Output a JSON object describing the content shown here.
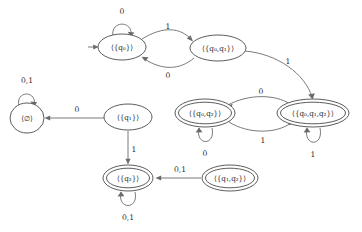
{
  "diagram": {
    "type": "finite-state-machine",
    "alphabet": [
      "0",
      "1"
    ],
    "stroke_color": "#6b6b6b",
    "node_color": "#4a4a4a",
    "text_color": "#2b2b2b",
    "background": "#ffffff",
    "start_state": "q0_set",
    "states": [
      {
        "id": "q0_set",
        "label": "⟨{q₀}⟩",
        "accepting": false,
        "x": 122,
        "y": 47,
        "rx": 24,
        "ry": 13
      },
      {
        "id": "q0q1_set",
        "label": "⟨{q₀,q₁}⟩",
        "accepting": false,
        "x": 218,
        "y": 48,
        "rx": 28,
        "ry": 13
      },
      {
        "id": "empty_set",
        "label": "⟨∅⟩",
        "accepting": false,
        "x": 27,
        "y": 118,
        "rx": 17,
        "ry": 15
      },
      {
        "id": "q1_set",
        "label": "⟨{q₁}⟩",
        "accepting": false,
        "x": 128,
        "y": 117,
        "rx": 24,
        "ry": 13
      },
      {
        "id": "q0q2_set",
        "label": "⟨{q₀,q₂}⟩",
        "accepting": true,
        "x": 205,
        "y": 113,
        "rx": 30,
        "ry": 14
      },
      {
        "id": "q0q1q2_set",
        "label": "⟨{q₀,q₁,q₂}⟩",
        "accepting": true,
        "x": 313,
        "y": 113,
        "rx": 36,
        "ry": 14
      },
      {
        "id": "q2_set",
        "label": "⟨{q₂}⟩",
        "accepting": true,
        "x": 128,
        "y": 178,
        "rx": 25,
        "ry": 13
      },
      {
        "id": "q1q2_set",
        "label": "⟨{q₁,q₂}⟩",
        "accepting": true,
        "x": 230,
        "y": 178,
        "rx": 28,
        "ry": 13
      }
    ],
    "transitions": [
      {
        "id": "t1",
        "from": "q0_set",
        "to": "q0_set",
        "symbol": "0",
        "label_x": 122,
        "label_y": 12,
        "kind": "self-loop-top"
      },
      {
        "id": "t2",
        "from": "q0_set",
        "to": "q0q1_set",
        "symbol": "1",
        "label_x": 168,
        "label_y": 27,
        "kind": "arc-top"
      },
      {
        "id": "t3",
        "from": "q0q1_set",
        "to": "q0_set",
        "symbol": "0",
        "label_x": 168,
        "label_y": 76,
        "kind": "arc-bottom"
      },
      {
        "id": "t4",
        "from": "q0q1_set",
        "to": "q0q1q2_set",
        "symbol": "1",
        "label_x": 288,
        "label_y": 62,
        "kind": "long-curve"
      },
      {
        "id": "t5",
        "from": "q1_set",
        "to": "empty_set",
        "symbol": "0",
        "label_x": 77,
        "label_y": 110,
        "kind": "straight-left"
      },
      {
        "id": "t6",
        "from": "empty_set",
        "to": "empty_set",
        "symbol": "0,1",
        "label_x": 27,
        "label_y": 81,
        "kind": "self-loop-top"
      },
      {
        "id": "t7",
        "from": "q1_set",
        "to": "q2_set",
        "symbol": "1",
        "label_x": 134,
        "label_y": 150,
        "kind": "straight-down"
      },
      {
        "id": "t8",
        "from": "q2_set",
        "to": "q2_set",
        "symbol": "0,1",
        "label_x": 128,
        "label_y": 218,
        "kind": "self-loop-bottom"
      },
      {
        "id": "t9",
        "from": "q1q2_set",
        "to": "q2_set",
        "symbol": "0,1",
        "label_x": 180,
        "label_y": 170,
        "kind": "straight-left"
      },
      {
        "id": "t10",
        "from": "q0q1q2_set",
        "to": "q0q2_set",
        "symbol": "0",
        "label_x": 261,
        "label_y": 92,
        "kind": "arc-top"
      },
      {
        "id": "t11",
        "from": "q0q2_set",
        "to": "q0q1q2_set",
        "symbol": "1",
        "label_x": 263,
        "label_y": 141,
        "kind": "arc-bottom"
      },
      {
        "id": "t12",
        "from": "q0q2_set",
        "to": "q0q2_set",
        "symbol": "0",
        "label_x": 205,
        "label_y": 154,
        "kind": "self-loop-bottom"
      },
      {
        "id": "t13",
        "from": "q0q1q2_set",
        "to": "q0q1q2_set",
        "symbol": "1",
        "label_x": 313,
        "label_y": 155,
        "kind": "self-loop-bottom"
      }
    ],
    "start_arrow": {
      "from_x": 88,
      "from_y": 47,
      "to_x": 98,
      "to_y": 47
    }
  }
}
